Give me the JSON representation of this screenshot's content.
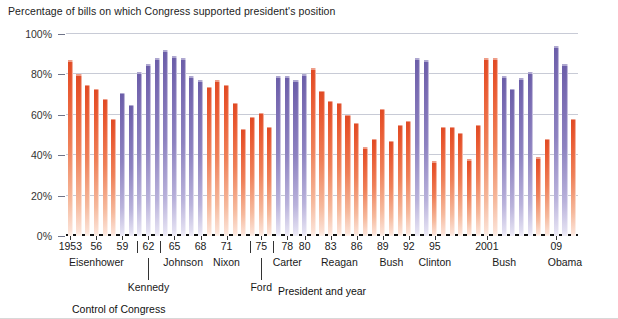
{
  "chart_title": "Percentage of bills on which Congress supported president's position",
  "axis": {
    "y_label_suffix": "%",
    "y_ticks": [
      "100%",
      "80%",
      "60%",
      "40%",
      "20%",
      "0%"
    ],
    "x_title": "President and year",
    "legend_title": "Control of Congress"
  },
  "colors": {
    "red": "#e8572f",
    "purple": "#7668b0",
    "gridline": "#9aa0b4",
    "axis": "#111111",
    "text": "#1a1a1a"
  },
  "presidents": [
    {
      "name": "Eisenhower",
      "center_year": 1956
    },
    {
      "name": "Kennedy",
      "center_year": 1962
    },
    {
      "name": "Johnson",
      "center_year": 1966
    },
    {
      "name": "Nixon",
      "center_year": 1971
    },
    {
      "name": "Ford",
      "center_year": 1975
    },
    {
      "name": "Carter",
      "center_year": 1978
    },
    {
      "name": "Reagan",
      "center_year": 1984
    },
    {
      "name": "Bush",
      "center_year": 1990
    },
    {
      "name": "Clinton",
      "center_year": 1995
    },
    {
      "name": "Bush",
      "center_year": 2003
    },
    {
      "name": "Obama",
      "center_year": 2010
    }
  ],
  "year_tick_labels": [
    {
      "year": 1953,
      "label": "1953"
    },
    {
      "year": 1956,
      "label": "56"
    },
    {
      "year": 1959,
      "label": "59"
    },
    {
      "year": 1962,
      "label": "62",
      "bracketed": true
    },
    {
      "year": 1965,
      "label": "65"
    },
    {
      "year": 1968,
      "label": "68"
    },
    {
      "year": 1971,
      "label": "71"
    },
    {
      "year": 1975,
      "label": "75",
      "bracketed": true
    },
    {
      "year": 1978,
      "label": "78"
    },
    {
      "year": 1980,
      "label": "80"
    },
    {
      "year": 1983,
      "label": "83"
    },
    {
      "year": 1986,
      "label": "86"
    },
    {
      "year": 1989,
      "label": "89"
    },
    {
      "year": 1992,
      "label": "92"
    },
    {
      "year": 1995,
      "label": "95"
    },
    {
      "year": 2001,
      "label": "2001"
    },
    {
      "year": 2009,
      "label": "09"
    }
  ],
  "chart_data": {
    "type": "bar",
    "title": "Percentage of bills on which Congress supported president's position",
    "xlabel": "President and year",
    "ylabel": "",
    "ylim": [
      0,
      100
    ],
    "grid": true,
    "legend_position": "none",
    "legend_title": "Control of Congress",
    "series_colors": {
      "opposition": "#e8572f",
      "president_party": "#7668b0"
    },
    "categories": [
      1953,
      1954,
      1955,
      1956,
      1957,
      1958,
      1959,
      1960,
      1961,
      1962,
      1963,
      1964,
      1965,
      1966,
      1967,
      1968,
      1969,
      1970,
      1971,
      1972,
      1973,
      1974,
      1975,
      1976,
      1977,
      1978,
      1979,
      1980,
      1981,
      1982,
      1983,
      1984,
      1985,
      1986,
      1987,
      1988,
      1989,
      1990,
      1991,
      1992,
      1993,
      1994,
      1995,
      1996,
      1997,
      1998,
      1999,
      2000,
      2001,
      2002,
      2003,
      2004,
      2005,
      2006,
      2007,
      2008,
      2009,
      2010,
      2011
    ],
    "values": [
      87,
      80,
      75,
      73,
      68,
      58,
      71,
      65,
      81,
      85,
      88,
      92,
      89,
      88,
      79,
      77,
      74,
      77,
      75,
      66,
      53,
      59,
      61,
      54,
      79,
      79,
      77,
      80,
      83,
      72,
      67,
      66,
      60,
      56,
      44,
      48,
      63,
      47,
      55,
      57,
      88,
      87,
      37,
      54,
      54,
      51,
      38,
      55,
      88,
      88,
      79,
      73,
      78,
      81,
      39,
      48,
      94,
      85,
      58
    ],
    "bar_colors": [
      "red",
      "red",
      "red",
      "red",
      "red",
      "red",
      "purple",
      "purple",
      "purple",
      "purple",
      "purple",
      "purple",
      "purple",
      "purple",
      "purple",
      "purple",
      "red",
      "red",
      "red",
      "red",
      "red",
      "red",
      "red",
      "red",
      "purple",
      "purple",
      "purple",
      "purple",
      "red",
      "red",
      "red",
      "red",
      "red",
      "red",
      "red",
      "red",
      "red",
      "red",
      "red",
      "red",
      "purple",
      "purple",
      "red",
      "red",
      "red",
      "red",
      "red",
      "red",
      "red",
      "red",
      "purple",
      "purple",
      "purple",
      "purple",
      "red",
      "red",
      "purple",
      "purple",
      "red"
    ]
  }
}
